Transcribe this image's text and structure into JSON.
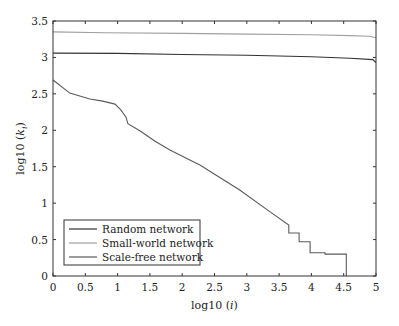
{
  "chart_data": {
    "type": "line",
    "title": "",
    "xlabel": "log10 (i)",
    "ylabel": "log10 (k_i)",
    "xlabel_parts": {
      "prefix": "log10 (",
      "var": "i",
      "suffix": ")"
    },
    "ylabel_parts": {
      "prefix": "log10 (",
      "var": "k",
      "sub": "i",
      "suffix": ")"
    },
    "xlim": [
      0,
      5
    ],
    "ylim": [
      0,
      3.5
    ],
    "xticks": [
      0,
      0.5,
      1,
      1.5,
      2,
      2.5,
      3,
      3.5,
      4,
      4.5,
      5
    ],
    "xtick_labels": [
      "0",
      "0.5",
      "1",
      "1.5",
      "2",
      "2.5",
      "3",
      "3.5",
      "4",
      "4.5",
      "5"
    ],
    "yticks": [
      0,
      0.5,
      1,
      1.5,
      2,
      2.5,
      3,
      3.5
    ],
    "ytick_labels": [
      "0",
      "0.5",
      "1",
      "1.5",
      "2",
      "2.5",
      "3",
      "3.5"
    ],
    "grid": false,
    "legend_position": "lower left",
    "series": [
      {
        "name": "Random network",
        "color": "#333333",
        "x": [
          0,
          1,
          2,
          3,
          4,
          4.6,
          4.95,
          5
        ],
        "y": [
          3.06,
          3.055,
          3.04,
          3.03,
          3.01,
          2.99,
          2.97,
          2.93
        ]
      },
      {
        "name": "Small-world network",
        "color": "#a0a0a0",
        "x": [
          0,
          0.8,
          2,
          3,
          4,
          4.6,
          4.9,
          5
        ],
        "y": [
          3.35,
          3.34,
          3.33,
          3.32,
          3.31,
          3.3,
          3.29,
          3.27
        ]
      },
      {
        "name": "Scale-free network",
        "color": "#5a5a5a",
        "x": [
          0,
          0.26,
          0.57,
          0.77,
          0.96,
          1.05,
          1.13,
          1.16,
          1.35,
          1.58,
          1.81,
          2.28,
          2.89,
          3.36,
          3.65,
          3.65,
          3.81,
          3.81,
          3.98,
          3.98,
          4.21,
          4.21,
          4.54,
          4.54
        ],
        "y": [
          2.69,
          2.51,
          2.43,
          2.4,
          2.36,
          2.28,
          2.18,
          2.09,
          1.99,
          1.85,
          1.73,
          1.52,
          1.18,
          0.88,
          0.7,
          0.59,
          0.59,
          0.47,
          0.47,
          0.32,
          0.32,
          0.3,
          0.3,
          0.0
        ]
      }
    ]
  },
  "layout": {
    "plot_left": 53,
    "plot_right": 376,
    "plot_top": 21,
    "plot_bottom": 276
  }
}
